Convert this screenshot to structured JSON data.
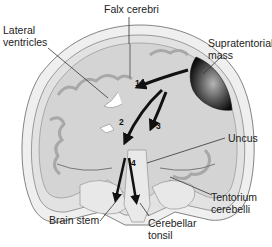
{
  "diagram": {
    "type": "anatomical-cross-section",
    "colors": {
      "skull": "#e6e6e6",
      "brain_tissue": "#d6d6d6",
      "gray_matter": "#b8b8b8",
      "mass_dark": "#111111",
      "mass_light": "#9a9a9a",
      "arrows": "#111111",
      "leader_lines": "#333333"
    },
    "labels": {
      "falx_cerebri": "Falx cerebri",
      "lateral_ventricles_line1": "Lateral",
      "lateral_ventricles_line2": "ventricles",
      "supratentorial_mass_line1": "Supratentorial",
      "supratentorial_mass_line2": "mass",
      "uncus": "Uncus",
      "tentorium_cerebelli_line1": "Tentorium",
      "tentorium_cerebelli_line2": "cerebelli",
      "brain_stem": "Brain stem",
      "cerebellar_tonsil_line1": "Cerebellar",
      "cerebellar_tonsil_line2": "tonsil"
    },
    "arrows": [
      {
        "number": "1",
        "description": "subfalcine herniation (under falx cerebri)"
      },
      {
        "number": "2",
        "description": "central herniation"
      },
      {
        "number": "3",
        "description": "transtentorial herniation"
      },
      {
        "number": "4",
        "description": "tonsillar herniation"
      }
    ]
  }
}
